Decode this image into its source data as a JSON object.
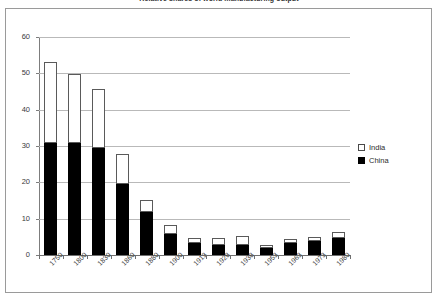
{
  "chart_data": {
    "type": "bar",
    "subtype": "stacked-bar",
    "title": "Relative shares of world manufacturing output",
    "xlabel": "",
    "ylabel": "",
    "ylim": [
      0,
      60
    ],
    "yticks": [
      0,
      10,
      20,
      30,
      40,
      50,
      60
    ],
    "ytick_labels": [
      "0",
      "10",
      "20",
      "30",
      "40",
      "50",
      "60"
    ],
    "grid": true,
    "grid_axis": "y",
    "legend_position": "right",
    "categories": [
      "1750",
      "1800",
      "1830",
      "1860",
      "1880",
      "1900",
      "1913",
      "1928",
      "1938",
      "1953",
      "1963",
      "1973",
      "1980"
    ],
    "series": [
      {
        "name": "China",
        "color": "#000000",
        "values": [
          31.0,
          31.0,
          29.8,
          19.7,
          12.0,
          6.0,
          3.5,
          3.0,
          3.0,
          2.3,
          3.5,
          4.0,
          5.0
        ]
      },
      {
        "name": "India",
        "color": "#ffffff",
        "values": [
          22.3,
          19.0,
          16.2,
          8.3,
          3.5,
          2.5,
          1.5,
          2.0,
          2.5,
          0.8,
          1.3,
          1.2,
          1.5
        ]
      }
    ],
    "totals": [
      53.3,
      50.0,
      46.0,
      28.0,
      15.5,
      8.5,
      5.0,
      5.0,
      5.5,
      3.1,
      4.8,
      5.2,
      6.5
    ]
  },
  "legend": {
    "items": [
      {
        "label": "India",
        "swatch": "hollow-square-swatch"
      },
      {
        "label": "China",
        "swatch": "filled-square-swatch"
      }
    ]
  }
}
